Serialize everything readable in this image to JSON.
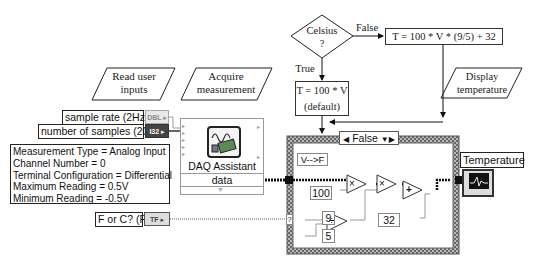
{
  "flowchart": {
    "read_inputs": "Read user inputs",
    "read_inputs_l1": "Read user",
    "read_inputs_l2": "inputs",
    "acquire_l1": "Acquire",
    "acquire_l2": "measurement",
    "decision_l1": "Celsius",
    "decision_l2": "?",
    "false_label": "False",
    "true_label": "True",
    "fahrenheit_formula": "T = 100 * V * (9/5) + 32",
    "celsius_formula_l1": "T = 100 * V",
    "celsius_formula_l2": "(default)",
    "display_l1": "Display",
    "display_l2": "temperature"
  },
  "block_diagram": {
    "controls": [
      {
        "label": "sample rate (2Hz)",
        "type": "DBL"
      },
      {
        "label": "number of samples (20)",
        "type": "I32"
      },
      {
        "label": "F or C? (F)",
        "type": "TF"
      }
    ],
    "config_text": [
      "Measurement Type = Analog Input",
      "Channel Number = 0",
      "Terminal Configuration = Differential",
      "Maximum Reading = 0.5V",
      "Minimum Reading = -0.5V"
    ],
    "daq": {
      "title": "DAQ Assistant",
      "output": "data"
    },
    "case_structure": {
      "selector": "False",
      "label": "V-->F",
      "selector_terminal": "?",
      "constants": [
        "100",
        "9",
        "5",
        "32"
      ],
      "ops": {
        "multiply": "×",
        "divide": "÷",
        "add": "+"
      }
    },
    "indicator": {
      "label": "Temperature"
    }
  },
  "colors": {
    "wire_orange": "#333333",
    "wire_green": "#6a6a6a",
    "structure_border": "#888888"
  }
}
